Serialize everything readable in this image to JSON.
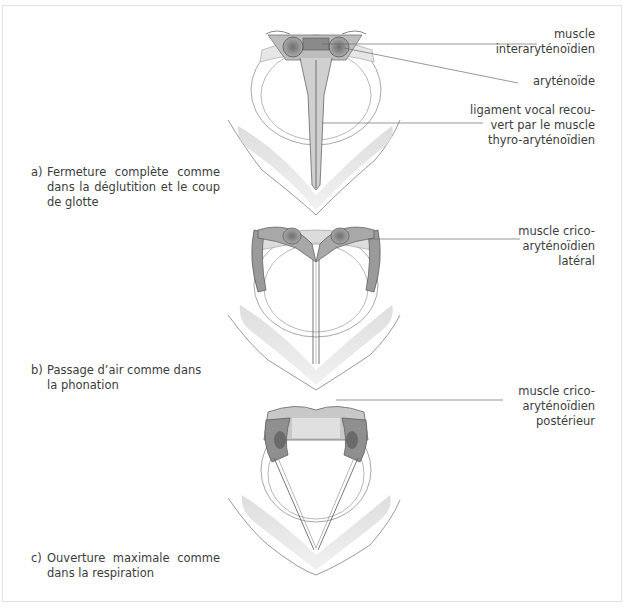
{
  "figure": {
    "panels": [
      {
        "id": "a",
        "letter": "a)",
        "caption": "Fermeture complète comme dans la déglutition et le coup de glotte",
        "state": "closed"
      },
      {
        "id": "b",
        "letter": "b)",
        "caption": "Passage d’air comme dans la phonation",
        "state": "phonation"
      },
      {
        "id": "c",
        "letter": "c)",
        "caption": "Ouverture maximale comme dans la respiration",
        "state": "open"
      }
    ],
    "labels": {
      "interarytenoid": [
        "muscle",
        "interaryténoïdien"
      ],
      "arytenoid": [
        "aryténoïde"
      ],
      "vocal_ligament": [
        "ligament vocal recou-",
        "vert par le muscle",
        "thyro-aryténoïdien"
      ],
      "crico_lateral": [
        "muscle crico-",
        "aryténoïdien",
        "latéral"
      ],
      "crico_posterior": [
        "muscle crico-",
        "aryténoïdien",
        "postérieur"
      ]
    },
    "colors": {
      "ink": "#3c3c3c",
      "leader_line": "#6a6a6a",
      "muscle_shade": "#8a8a8a",
      "cartilage_fill": "#e4e4e4",
      "frame": "#e2e2e2"
    }
  }
}
